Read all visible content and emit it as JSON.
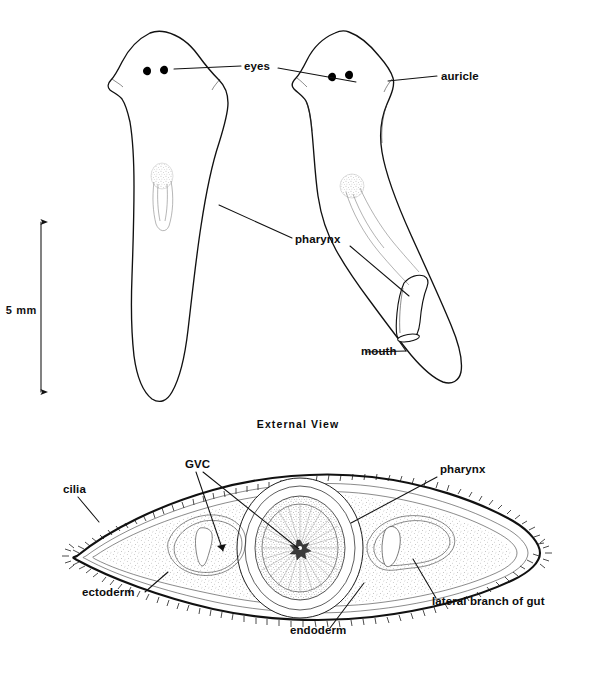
{
  "figure": {
    "background_color": "#ffffff",
    "ink_color": "#111111",
    "width": 596,
    "height": 677
  },
  "scale_bar": {
    "label": "5 mm",
    "orientation": "vertical",
    "arrowheads": "both"
  },
  "panels": [
    {
      "id": "external",
      "caption": "External  View",
      "specimens": [
        {
          "id": "left-specimen",
          "name": "dorsal view, pharynx retracted",
          "features": [
            "eyes",
            "auricle",
            "pharynx"
          ]
        },
        {
          "id": "right-specimen",
          "name": "dorsal view, pharynx everted",
          "features": [
            "eyes",
            "auricle",
            "pharynx",
            "mouth"
          ]
        }
      ]
    },
    {
      "id": "cross-section",
      "caption": "",
      "name": "transverse section through pharynx region"
    }
  ],
  "labels_external": [
    {
      "id": "eyes",
      "text": "eyes"
    },
    {
      "id": "auricle",
      "text": "auricle"
    },
    {
      "id": "pharynx",
      "text": "pharynx"
    },
    {
      "id": "mouth",
      "text": "mouth"
    }
  ],
  "labels_section": [
    {
      "id": "cilia",
      "text": "cilia"
    },
    {
      "id": "gvc",
      "text": "GVC"
    },
    {
      "id": "pharynx",
      "text": "pharynx"
    },
    {
      "id": "ectoderm",
      "text": "ectoderm"
    },
    {
      "id": "endoderm",
      "text": "endoderm"
    },
    {
      "id": "lateral-gut",
      "text": "lateral branch of gut"
    }
  ]
}
